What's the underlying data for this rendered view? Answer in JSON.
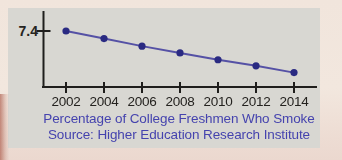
{
  "colors": {
    "paper": "#f1e5dc",
    "paper_bottom": "#ebd8cf",
    "panel": "#d8d7d2",
    "axis": "#1f1e1c",
    "line": "#5551a5",
    "marker": "#2a2a82",
    "tick_text": "#24221f",
    "caption_text": "#4543ae",
    "scan_edge_red": "#9e3e2b"
  },
  "chart_data": {
    "type": "line",
    "title": "Percentage of College Freshmen Who Smoke",
    "source": "Source: Higher Education Research Institute",
    "categories": [
      "2002",
      "2004",
      "2006",
      "2008",
      "2010",
      "2012",
      "2014"
    ],
    "series": [
      {
        "name": "percent-of-freshmen-who-smoke",
        "values": [
          7.4,
          6.4,
          5.4,
          4.5,
          3.6,
          2.8,
          1.9
        ]
      }
    ],
    "y_tick_labels": [
      "7.4"
    ],
    "ylim": [
      0,
      9.4
    ],
    "grid": false,
    "legend": false,
    "marker": "circle"
  }
}
